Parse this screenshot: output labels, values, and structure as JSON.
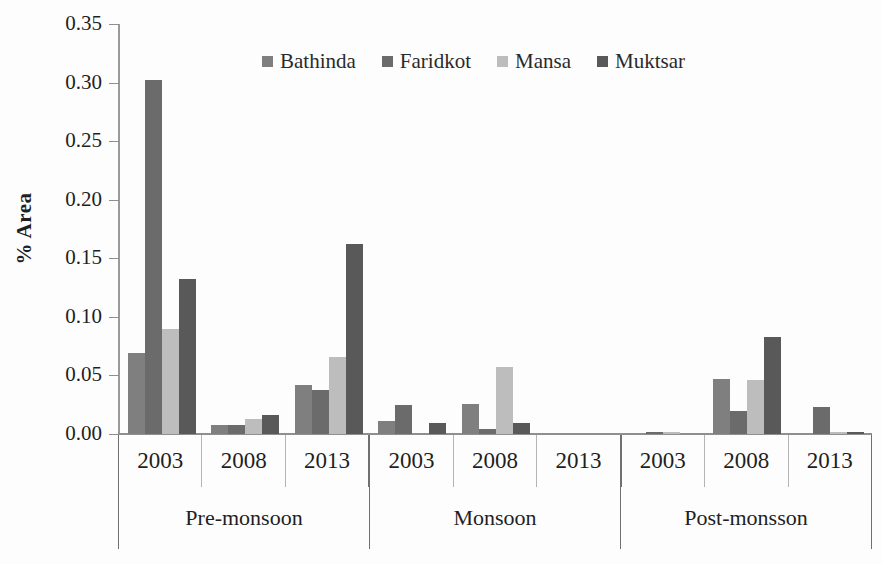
{
  "chart_data": {
    "type": "bar",
    "title": "",
    "xlabel": "",
    "ylabel": "% Area",
    "ylim": [
      0.0,
      0.35
    ],
    "ytick_labels": [
      "0.35",
      "0.30",
      "0.25",
      "0.20",
      "0.15",
      "0.10",
      "0.05",
      "0.00"
    ],
    "ytick_values": [
      0.35,
      0.3,
      0.25,
      0.2,
      0.15,
      0.1,
      0.05,
      0.0
    ],
    "grid": false,
    "legend_position": "top-center",
    "categories": [
      "2003",
      "2008",
      "2013",
      "2003",
      "2008",
      "2013",
      "2003",
      "2008",
      "2013"
    ],
    "group_labels": [
      "Pre-monsoon",
      "Monsoon",
      "Post-monsson"
    ],
    "group_span": 3,
    "series": [
      {
        "name": "Bathinda",
        "color": "#7f7f7f",
        "values": [
          0.069,
          0.008,
          0.042,
          0.011,
          0.026,
          0.0,
          0.0,
          0.047,
          0.0
        ]
      },
      {
        "name": "Faridkot",
        "color": "#6b6b6b",
        "values": [
          0.302,
          0.008,
          0.038,
          0.025,
          0.004,
          0.0,
          0.002,
          0.02,
          0.023
        ]
      },
      {
        "name": "Mansa",
        "color": "#bdbdbd",
        "values": [
          0.09,
          0.013,
          0.066,
          0.0,
          0.057,
          0.0,
          0.002,
          0.046,
          0.002
        ]
      },
      {
        "name": "Muktsar",
        "color": "#595959",
        "values": [
          0.132,
          0.016,
          0.162,
          0.009,
          0.009,
          0.0,
          0.0,
          0.083,
          0.002
        ]
      }
    ]
  }
}
